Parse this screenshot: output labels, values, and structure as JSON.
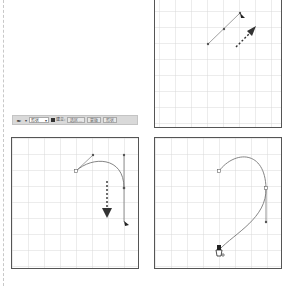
{
  "toolbar": {
    "tool_icon": "pen-tool-icon",
    "tool_dropdown_glyph": "▾",
    "mode_select": "形状",
    "mode_arrow": "▾",
    "checkbox_label": "建立:",
    "buttons": [
      "选区...",
      "蒙版",
      "形状"
    ]
  },
  "panels": [
    {
      "name": "panel-top-right",
      "description": "straight segment with drag direction arrow"
    },
    {
      "name": "panel-bottom-left",
      "description": "curve drawn with downward drag arrow"
    },
    {
      "name": "panel-bottom-right",
      "description": "completed curved path with pen cursor"
    }
  ],
  "colors": {
    "grid": "#d8d8d8",
    "border": "#555555",
    "path": "#777777",
    "arrow": "#333333",
    "toolbar_bg": "#d9d9d9"
  }
}
